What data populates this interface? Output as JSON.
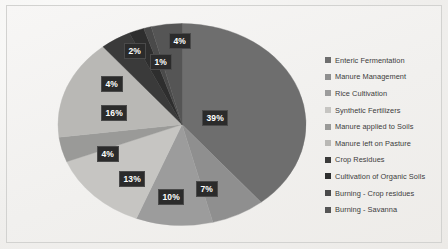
{
  "chart_data": {
    "type": "pie",
    "title": "",
    "legend_position": "right",
    "labels": [
      "Enteric Fermentation",
      "Manure Management",
      "Rice Cultivation",
      "Synthetic Fertilizers",
      "Manure applied to Soils",
      "Manure left on Pasture",
      "Crop Residues",
      "Cultivation of Organic Soils",
      "Burning - Crop residues",
      "Burning - Savanna"
    ],
    "values": [
      39,
      7,
      10,
      13,
      4,
      16,
      4,
      2,
      1,
      4
    ],
    "value_labels": [
      "39%",
      "7%",
      "10%",
      "13%",
      "4%",
      "16%",
      "4%",
      "2%",
      "1%",
      "4%"
    ],
    "colors": [
      "#6e6e6e",
      "#8f8f8f",
      "#9c9c9c",
      "#c6c5c2",
      "#9a9a98",
      "#b9b8b5",
      "#3a3a3a",
      "#2e2e2e",
      "#4a4a4a",
      "#555555"
    ],
    "unit": "percent"
  },
  "legend": {
    "items": [
      {
        "label": "Enteric Fermentation",
        "color": "#6e6e6e"
      },
      {
        "label": "Manure Management",
        "color": "#8f8f8f"
      },
      {
        "label": "Rice Cultivation",
        "color": "#9c9c9c"
      },
      {
        "label": "Synthetic Fertilizers",
        "color": "#c6c5c2"
      },
      {
        "label": "Manure applied to Soils",
        "color": "#9a9a98"
      },
      {
        "label": "Manure left on Pasture",
        "color": "#b9b8b5"
      },
      {
        "label": "Crop Residues",
        "color": "#3a3a3a"
      },
      {
        "label": "Cultivation of Organic Soils",
        "color": "#2e2e2e"
      },
      {
        "label": "Burning - Crop residues",
        "color": "#4a4a4a"
      },
      {
        "label": "Burning - Savanna",
        "color": "#555555"
      }
    ]
  },
  "pct_labels": [
    {
      "text": "39%",
      "x": 202,
      "y": 110
    },
    {
      "text": "7%",
      "x": 196,
      "y": 181
    },
    {
      "text": "10%",
      "x": 158,
      "y": 189
    },
    {
      "text": "13%",
      "x": 119,
      "y": 171
    },
    {
      "text": "4%",
      "x": 97,
      "y": 146
    },
    {
      "text": "16%",
      "x": 101,
      "y": 105
    },
    {
      "text": "4%",
      "x": 101,
      "y": 76
    },
    {
      "text": "2%",
      "x": 124,
      "y": 43
    },
    {
      "text": "1%",
      "x": 150,
      "y": 54
    },
    {
      "text": "4%",
      "x": 169,
      "y": 33
    }
  ]
}
